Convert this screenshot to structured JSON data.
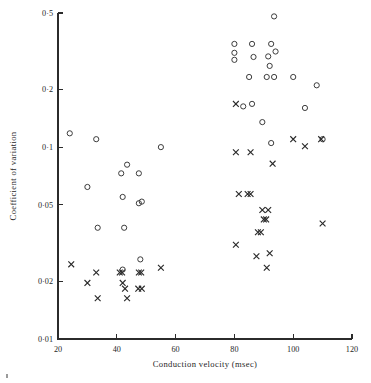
{
  "chart_data": {
    "type": "scatter",
    "title": "",
    "xlabel": "Conduction velocity (msec)",
    "ylabel": "Coefficient of variation",
    "xlim": [
      20,
      120
    ],
    "ylim": [
      0.01,
      0.5
    ],
    "yscale": "log",
    "xscale": "linear",
    "grid": false,
    "legend": "none",
    "xticks": [
      20,
      40,
      60,
      80,
      100,
      120
    ],
    "xticklabels": [
      "20",
      "40",
      "60",
      "80",
      "100",
      "120"
    ],
    "yticks": [
      0.01,
      0.02,
      0.05,
      0.1,
      0.2,
      0.5
    ],
    "yticklabels": [
      "0·01",
      "0·02",
      "0·05",
      "0·1",
      "0·2",
      "0·5"
    ],
    "series": [
      {
        "name": "circles",
        "marker": "circle",
        "points": [
          [
            24.0,
            0.118
          ],
          [
            33.0,
            0.11
          ],
          [
            55.0,
            0.1
          ],
          [
            30.0,
            0.062
          ],
          [
            43.5,
            0.081
          ],
          [
            41.5,
            0.073
          ],
          [
            47.5,
            0.073
          ],
          [
            42.0,
            0.055
          ],
          [
            47.5,
            0.051
          ],
          [
            48.5,
            0.052
          ],
          [
            33.5,
            0.038
          ],
          [
            42.5,
            0.038
          ],
          [
            48.0,
            0.026
          ],
          [
            42.0,
            0.023
          ],
          [
            80.0,
            0.345
          ],
          [
            80.0,
            0.31
          ],
          [
            80.0,
            0.285
          ],
          [
            86.0,
            0.345
          ],
          [
            86.5,
            0.295
          ],
          [
            92.5,
            0.345
          ],
          [
            91.5,
            0.297
          ],
          [
            94.0,
            0.315
          ],
          [
            92.0,
            0.265
          ],
          [
            93.5,
            0.48
          ],
          [
            85.0,
            0.232
          ],
          [
            91.0,
            0.232
          ],
          [
            93.5,
            0.232
          ],
          [
            100.0,
            0.232
          ],
          [
            108.0,
            0.21
          ],
          [
            83.0,
            0.163
          ],
          [
            86.0,
            0.168
          ],
          [
            104.0,
            0.16
          ],
          [
            89.5,
            0.135
          ],
          [
            92.5,
            0.105
          ],
          [
            110.0,
            0.11
          ]
        ]
      },
      {
        "name": "crosses",
        "marker": "cross",
        "points": [
          [
            24.5,
            0.0245
          ],
          [
            33.0,
            0.0222
          ],
          [
            41.0,
            0.0222
          ],
          [
            41.8,
            0.0222
          ],
          [
            47.5,
            0.0222
          ],
          [
            48.3,
            0.0222
          ],
          [
            55.0,
            0.0235
          ],
          [
            30.0,
            0.0196
          ],
          [
            42.0,
            0.0196
          ],
          [
            42.8,
            0.0183
          ],
          [
            47.3,
            0.0183
          ],
          [
            48.5,
            0.0183
          ],
          [
            33.5,
            0.0163
          ],
          [
            43.5,
            0.0163
          ],
          [
            80.5,
            0.168
          ],
          [
            80.5,
            0.094
          ],
          [
            85.5,
            0.094
          ],
          [
            93.0,
            0.082
          ],
          [
            100.0,
            0.11
          ],
          [
            104.0,
            0.101
          ],
          [
            109.5,
            0.11
          ],
          [
            81.5,
            0.057
          ],
          [
            84.5,
            0.057
          ],
          [
            85.5,
            0.057
          ],
          [
            89.5,
            0.047
          ],
          [
            91.5,
            0.047
          ],
          [
            90.0,
            0.042
          ],
          [
            90.8,
            0.042
          ],
          [
            88.0,
            0.036
          ],
          [
            89.0,
            0.036
          ],
          [
            80.5,
            0.031
          ],
          [
            87.5,
            0.027
          ],
          [
            92.0,
            0.028
          ],
          [
            91.0,
            0.0235
          ],
          [
            110.0,
            0.04
          ]
        ]
      }
    ]
  }
}
